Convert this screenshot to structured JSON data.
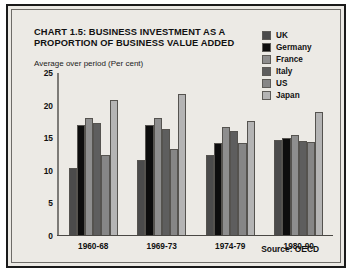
{
  "chart_data": {
    "type": "bar",
    "title": "CHART 1.5: BUSINESS INVESTMENT AS A PROPORTION OF BUSINESS VALUE ADDED",
    "title_lines": [
      "CHART 1.5: BUSINESS INVESTMENT AS A",
      "PROPORTION OF BUSINESS VALUE ADDED"
    ],
    "subtitle": "Average over period (Per cent)",
    "xlabel": "",
    "ylabel": "",
    "ylim": [
      0,
      25
    ],
    "yticks": [
      25,
      20,
      15,
      10,
      5,
      0
    ],
    "grid": false,
    "legend_position": "top-right",
    "categories": [
      "1960-68",
      "1969-73",
      "1974-79",
      "1980-90"
    ],
    "series": [
      {
        "name": "UK",
        "color": "#4b4b4b",
        "values": [
          10.3,
          11.5,
          12.3,
          14.7
        ]
      },
      {
        "name": "Germany",
        "color": "#0d0d0d",
        "values": [
          17.0,
          17.0,
          14.2,
          15.0
        ]
      },
      {
        "name": "France",
        "color": "#8e8e8e",
        "values": [
          18.0,
          18.0,
          16.6,
          15.4
        ]
      },
      {
        "name": "Italy",
        "color": "#5e5e5e",
        "values": [
          17.3,
          16.3,
          16.1,
          14.4
        ]
      },
      {
        "name": "US",
        "color": "#868686",
        "values": [
          12.3,
          13.3,
          14.2,
          14.3
        ]
      },
      {
        "name": "Japan",
        "color": "#b4b4b4",
        "values": [
          20.8,
          21.8,
          17.6,
          18.9
        ]
      }
    ],
    "annotations": [
      {
        "name": "source",
        "text": "Source: OECD"
      }
    ]
  },
  "source_note": "Source: OECD"
}
